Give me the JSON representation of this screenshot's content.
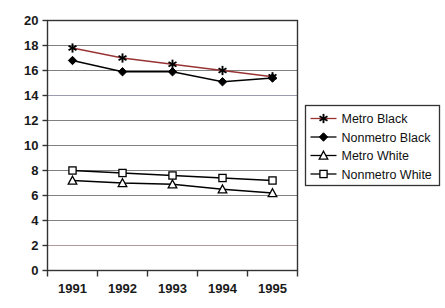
{
  "chart_data": {
    "type": "line",
    "title": "",
    "xlabel": "",
    "ylabel": "",
    "categories": [
      "1991",
      "1992",
      "1993",
      "1994",
      "1995"
    ],
    "ylim": [
      0,
      20
    ],
    "ytick_labels": [
      "0",
      "2",
      "4",
      "6",
      "8",
      "10",
      "12",
      "14",
      "16",
      "18",
      "20"
    ],
    "ytick_values": [
      0,
      2,
      4,
      6,
      8,
      10,
      12,
      14,
      16,
      18,
      20
    ],
    "grid": true,
    "legend_position": "right",
    "series": [
      {
        "name": "Metro Black",
        "values": [
          17.8,
          17.0,
          16.5,
          16.0,
          15.5
        ],
        "marker": "star",
        "color": "#000000",
        "line_color": "#993333"
      },
      {
        "name": "Nonmetro Black",
        "values": [
          16.8,
          15.9,
          15.9,
          15.1,
          15.4
        ],
        "marker": "diamond-filled",
        "color": "#000000",
        "line_color": "#000000"
      },
      {
        "name": "Metro White",
        "values": [
          7.2,
          7.0,
          6.9,
          6.5,
          6.2
        ],
        "marker": "triangle-open",
        "color": "#000000",
        "line_color": "#000000"
      },
      {
        "name": "Nonmetro White",
        "values": [
          8.0,
          7.8,
          7.6,
          7.4,
          7.2
        ],
        "marker": "square-open",
        "color": "#000000",
        "line_color": "#000000"
      }
    ]
  },
  "legend": {
    "items": [
      {
        "label": "Metro Black"
      },
      {
        "label": "Nonmetro Black"
      },
      {
        "label": "Metro White"
      },
      {
        "label": "Nonmetro White"
      }
    ]
  },
  "colors": {
    "gridline": "#808080",
    "axis": "#333333",
    "plot_border": "#333333",
    "legend_border": "#333333",
    "text": "#1a1a1a",
    "metro_black_line": "#993333",
    "gridline_14_tint": "#9a9ab0",
    "gridline_2_tint": "#b09a9a"
  }
}
